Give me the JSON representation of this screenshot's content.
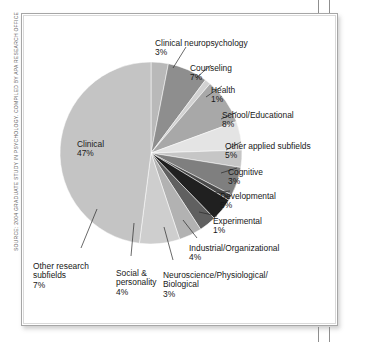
{
  "figure": {
    "source_credit": "SOURCE: 2004 GRADUATE STUDY IN PSYCHOLOGY. COMPILED BY APA RESEARCH OFFICE"
  },
  "chart_data": {
    "type": "pie",
    "title": "",
    "subtitle": "",
    "xlabel": "",
    "ylabel": "",
    "legend_position": "none",
    "grid": false,
    "labels_placement": "external-with-leader-lines",
    "units": "percent",
    "start_angle_deg": 0,
    "direction": "clockwise",
    "total": 98,
    "categories": [
      "Clinical neuropsychology",
      "Counseling",
      "Health",
      "School/Educational",
      "Other applied subfields",
      "Cognitive",
      "Developmental",
      "Experimental",
      "Industrial/Organizational",
      "Neuroscience/Physiological/\nBiological",
      "Social &\npersonality",
      "Other research\nsubfields",
      "Clinical"
    ],
    "values": [
      3,
      7,
      1,
      8,
      5,
      3,
      5,
      1,
      4,
      3,
      4,
      7,
      47
    ],
    "value_labels": [
      "3%",
      "7%",
      "1%",
      "8%",
      "5%",
      "3%",
      "5%",
      "1%",
      "4%",
      "3%",
      "4%",
      "7%",
      "47%"
    ],
    "colors": [
      "#b9b9b9",
      "#8e8e8e",
      "#d2d2d2",
      "#a8a8a8",
      "#e4e4e4",
      "#c6c6c6",
      "#7f7f7f",
      "#4a4a4a",
      "#202020",
      "#606060",
      "#b2b2b2",
      "#cecece",
      "#c4c4c4"
    ],
    "slices": [
      {
        "name": "Clinical neuropsychology",
        "value": 3,
        "label": "Clinical neuropsychology",
        "pct": "3%",
        "color": "#b9b9b9"
      },
      {
        "name": "Counseling",
        "value": 7,
        "label": "Counseling",
        "pct": "7%",
        "color": "#8e8e8e"
      },
      {
        "name": "Health",
        "value": 1,
        "label": "Health",
        "pct": "1%",
        "color": "#d2d2d2"
      },
      {
        "name": "School/Educational",
        "value": 8,
        "label": "School/Educational",
        "pct": "8%",
        "color": "#a8a8a8"
      },
      {
        "name": "Other applied subfields",
        "value": 5,
        "label": "Other applied subfields",
        "pct": "5%",
        "color": "#e4e4e4"
      },
      {
        "name": "Cognitive",
        "value": 3,
        "label": "Cognitive",
        "pct": "3%",
        "color": "#c6c6c6"
      },
      {
        "name": "Developmental",
        "value": 5,
        "label": "Developmental",
        "pct": "5%",
        "color": "#7f7f7f"
      },
      {
        "name": "Experimental",
        "value": 1,
        "label": "Experimental",
        "pct": "1%",
        "color": "#4a4a4a"
      },
      {
        "name": "Industrial/Organizational",
        "value": 4,
        "label": "Industrial/Organizational",
        "pct": "4%",
        "color": "#202020"
      },
      {
        "name": "Neuroscience",
        "value": 3,
        "label": "Neuroscience/Physiological/\nBiological",
        "pct": "3%",
        "color": "#606060"
      },
      {
        "name": "Social & personality",
        "value": 4,
        "label": "Social &\npersonality",
        "pct": "4%",
        "color": "#b2b2b2"
      },
      {
        "name": "Other research subfields",
        "value": 7,
        "label": "Other research\nsubfields",
        "pct": "7%",
        "color": "#cecece"
      },
      {
        "name": "Clinical",
        "value": 47,
        "label": "Clinical",
        "pct": "47%",
        "color": "#c4c4c4"
      }
    ]
  }
}
